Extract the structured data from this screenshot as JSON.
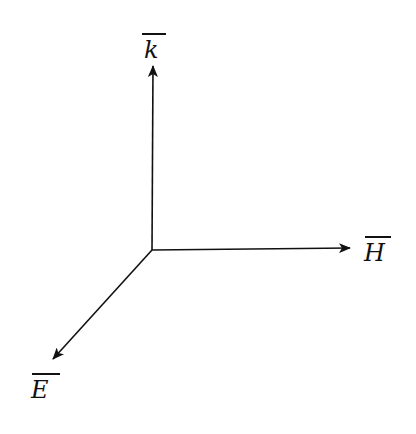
{
  "diagram": {
    "type": "3d-axes",
    "origin": [
      152,
      250
    ],
    "axes": [
      {
        "id": "k",
        "label": "k",
        "overline": true,
        "direction": "up",
        "tip": [
          153,
          64
        ]
      },
      {
        "id": "H",
        "label": "H",
        "overline": true,
        "direction": "right",
        "tip": [
          352,
          248
        ]
      },
      {
        "id": "E",
        "label": "E",
        "overline": true,
        "direction": "down-left",
        "tip": [
          52,
          360
        ]
      }
    ],
    "stroke_color": "#111111"
  }
}
